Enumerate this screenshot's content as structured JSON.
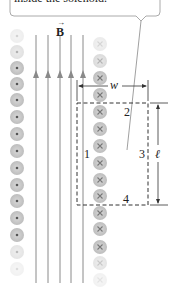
{
  "callout": {
    "text": "inside the solenoid."
  },
  "field": {
    "label": "B",
    "vector_arrow": "→",
    "line_count": 5,
    "color": "#8a8a8a"
  },
  "loop": {
    "sides": {
      "side1": "1",
      "side2": "2",
      "side3": "3",
      "side4": "4"
    },
    "width_label": "w",
    "length_label": "ℓ"
  },
  "wires": {
    "left_column": {
      "symbol": "dot",
      "meaning": "current out of page",
      "count": 15
    },
    "right_column": {
      "symbol": "cross",
      "meaning": "current into page",
      "count": 15
    },
    "color": "#c8c8c8"
  }
}
